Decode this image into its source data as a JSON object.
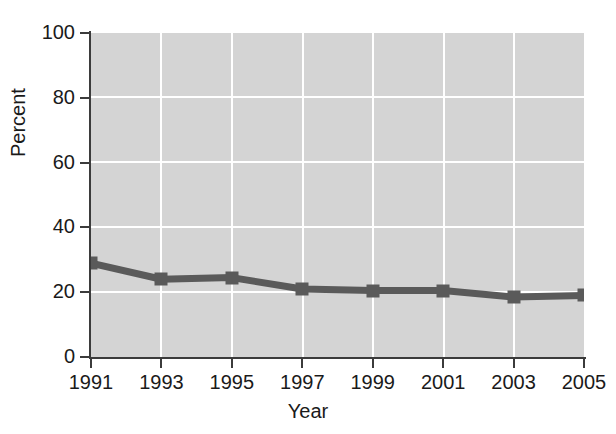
{
  "chart_data": {
    "type": "line",
    "title": "",
    "subtitle": "",
    "xlabel": "Year",
    "ylabel": "Percent",
    "x": [
      1991,
      1993,
      1995,
      1997,
      1999,
      2001,
      2003,
      2005
    ],
    "xtick_labels": [
      "1991",
      "1993",
      "1995",
      "1997",
      "1999",
      "2001",
      "2003",
      "2005"
    ],
    "values": [
      29,
      24,
      24.5,
      21,
      20.5,
      20.5,
      18.5,
      19
    ],
    "ytick_labels": [
      "0",
      "20",
      "40",
      "60",
      "80",
      "100"
    ],
    "yticks": [
      0,
      20,
      40,
      60,
      80,
      100
    ],
    "xlim": [
      1991,
      2005
    ],
    "ylim": [
      0,
      100
    ],
    "grid": "horizontal-and-vertical",
    "legend": "none",
    "marker": "square",
    "series": [
      {
        "name": "Percent",
        "values": [
          29,
          24,
          24.5,
          21,
          20.5,
          20.5,
          18.5,
          19
        ]
      }
    ],
    "colors": {
      "plot_background": "#d4d4d4",
      "gridline": "#ffffff",
      "line": "#5a5a5a",
      "marker": "#5a5a5a",
      "axis": "#3b3b3b",
      "text": "#1a1a1a",
      "figure_background": "#ffffff"
    }
  }
}
